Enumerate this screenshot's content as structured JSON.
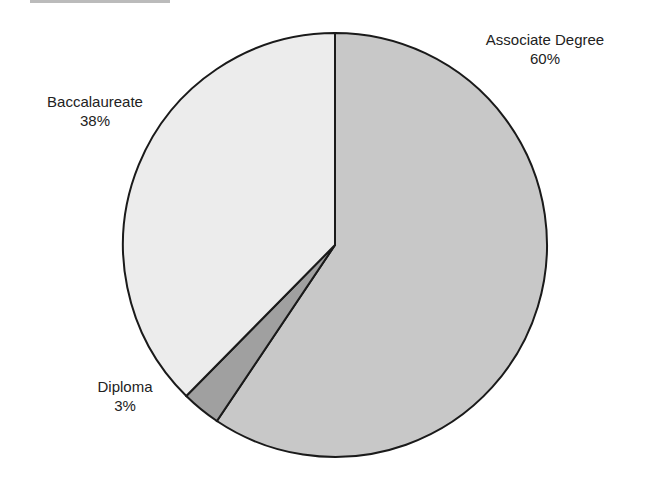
{
  "chart_data": {
    "type": "pie",
    "title": "",
    "slices": [
      {
        "label": "Associate Degree",
        "value": 60,
        "display": "60%",
        "color": "#c8c8c8"
      },
      {
        "label": "Diploma",
        "value": 3,
        "display": "3%",
        "color": "#a0a0a0"
      },
      {
        "label": "Baccalaureate",
        "value": 38,
        "display": "38%",
        "color": "#ececec"
      }
    ],
    "legend": "none",
    "labels_position": "outside"
  },
  "labels": {
    "associate": {
      "name": "Associate Degree",
      "pct": "60%"
    },
    "diploma": {
      "name": "Diploma",
      "pct": "3%"
    },
    "baccalaureate": {
      "name": "Baccalaureate",
      "pct": "38%"
    }
  }
}
